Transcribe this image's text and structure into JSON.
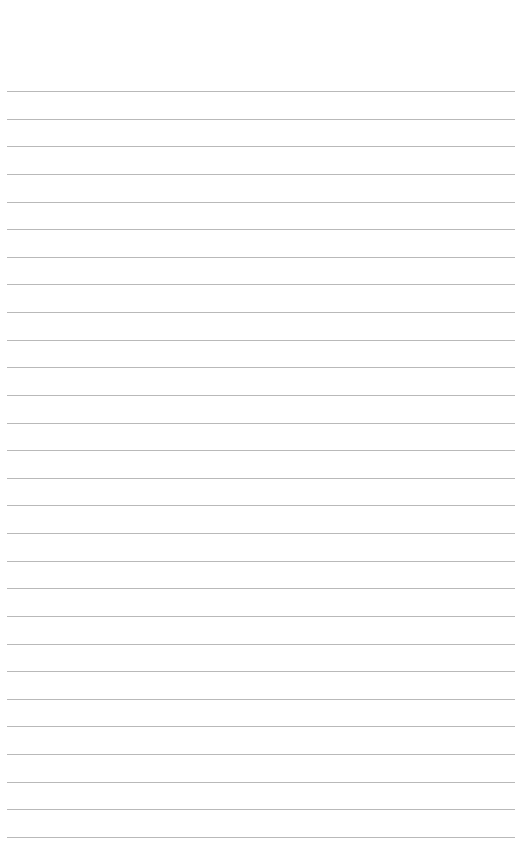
{
  "page": {
    "type": "lined-paper",
    "background_color": "#ffffff",
    "rule_color": "#b9b9b9",
    "rule_count": 28,
    "first_rule_y": 91,
    "rule_spacing": 27.63,
    "rule_left": 7,
    "rule_width": 508
  }
}
